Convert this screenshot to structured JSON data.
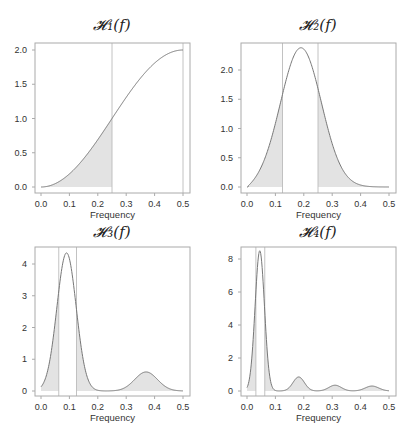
{
  "chart_data": [
    {
      "type": "area",
      "title": "H1(f)",
      "title_display": "𝓗₁(f)",
      "xlabel": "Frequency",
      "ylabel": "",
      "xlim": [
        0.0,
        0.5
      ],
      "ylim": [
        0.0,
        2.0
      ],
      "xticks": [
        "0.0",
        "0.1",
        "0.2",
        "0.3",
        "0.4",
        "0.5"
      ],
      "yticks": [
        "0.0",
        "0.5",
        "1.0",
        "1.5",
        "2.0"
      ],
      "vlines": [
        0.25,
        0.5
      ],
      "shaded_regions": [
        [
          0.0,
          0.25
        ]
      ],
      "function": "2*sin^2(pi f)",
      "x": [
        0.0,
        0.05,
        0.1,
        0.15,
        0.2,
        0.25,
        0.3,
        0.35,
        0.4,
        0.45,
        0.5
      ],
      "values": [
        0.0,
        0.05,
        0.19,
        0.41,
        0.69,
        1.0,
        1.31,
        1.59,
        1.81,
        1.95,
        2.0
      ],
      "grid": false
    },
    {
      "type": "area",
      "title": "H2(f)",
      "title_display": "𝓗₂(f)",
      "xlabel": "Frequency",
      "ylabel": "",
      "xlim": [
        0.0,
        0.5
      ],
      "ylim": [
        0.0,
        2.4
      ],
      "xticks": [
        "0.0",
        "0.1",
        "0.2",
        "0.3",
        "0.4",
        "0.5"
      ],
      "yticks": [
        "0.0",
        "0.5",
        "1.0",
        "1.5",
        "2.0"
      ],
      "vlines": [
        0.125,
        0.25
      ],
      "shaded_regions": [
        [
          0.0,
          0.125
        ],
        [
          0.25,
          0.5
        ]
      ],
      "x": [
        0.0,
        0.05,
        0.1,
        0.125,
        0.15,
        0.2,
        0.25,
        0.3,
        0.35,
        0.4,
        0.45,
        0.5
      ],
      "values": [
        0.0,
        0.18,
        1.03,
        1.71,
        2.02,
        2.37,
        2.0,
        1.14,
        0.41,
        0.07,
        0.0,
        0.0
      ],
      "grid": false
    },
    {
      "type": "area",
      "title": "H3(f)",
      "title_display": "𝓗₃(f)",
      "xlabel": "Frequency",
      "ylabel": "",
      "xlim": [
        0.0,
        0.5
      ],
      "ylim": [
        0,
        4.4
      ],
      "xticks": [
        "0.0",
        "0.1",
        "0.2",
        "0.3",
        "0.4",
        "0.5"
      ],
      "yticks": [
        "0",
        "1",
        "2",
        "3",
        "4"
      ],
      "vlines": [
        0.0625,
        0.125
      ],
      "shaded_regions": [
        [
          0.0,
          0.0625
        ],
        [
          0.125,
          0.5
        ]
      ],
      "x": [
        0.0,
        0.03,
        0.0625,
        0.09,
        0.125,
        0.15,
        0.2,
        0.25,
        0.3,
        0.37,
        0.43,
        0.5
      ],
      "values": [
        0.0,
        0.85,
        3.4,
        4.35,
        3.3,
        1.8,
        0.2,
        0.0,
        0.1,
        0.6,
        0.25,
        0.0
      ],
      "grid": false
    },
    {
      "type": "area",
      "title": "H4(f)",
      "title_display": "𝓗₄(f)",
      "xlabel": "Frequency",
      "ylabel": "",
      "xlim": [
        0.0,
        0.5
      ],
      "ylim": [
        0,
        8.6
      ],
      "xticks": [
        "0.0",
        "0.1",
        "0.2",
        "0.3",
        "0.4",
        "0.5"
      ],
      "yticks": [
        "0",
        "2",
        "4",
        "6",
        "8"
      ],
      "vlines": [
        0.03125,
        0.0625
      ],
      "shaded_regions": [
        [
          0.0,
          0.03125
        ],
        [
          0.0625,
          0.5
        ]
      ],
      "x": [
        0.0,
        0.03125,
        0.045,
        0.0625,
        0.1,
        0.125,
        0.18,
        0.25,
        0.31,
        0.375,
        0.44,
        0.5
      ],
      "values": [
        0.0,
        6.0,
        8.5,
        6.3,
        0.1,
        0.0,
        0.85,
        0.0,
        0.35,
        0.0,
        0.3,
        0.0
      ],
      "grid": false
    }
  ],
  "colors": {
    "curve": "#777777",
    "fill": "#e3e3e3",
    "axis": "#aaaaaa",
    "vline": "#bbbbbb",
    "text": "#333333"
  }
}
